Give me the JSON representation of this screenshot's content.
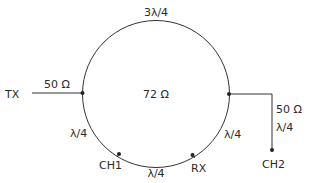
{
  "diagram": {
    "type": "rat-race hybrid ring coupler",
    "ring": {
      "impedance_label": "72 Ω",
      "top_arc_label": "3λ/4",
      "left_lower_arc_label": "λ/4",
      "bottom_arc_label": "λ/4",
      "right_lower_arc_label": "λ/4"
    },
    "ports": {
      "tx": {
        "label": "TX",
        "line_label": "50 Ω"
      },
      "ch1": {
        "label": "CH1"
      },
      "rx": {
        "label": "RX"
      },
      "ch2": {
        "label": "CH2",
        "line_impedance_label": "50 Ω",
        "line_length_label": "λ/4"
      }
    },
    "colors": {
      "line": "#333333",
      "text": "#2a2a2a",
      "background": "#ffffff"
    }
  }
}
